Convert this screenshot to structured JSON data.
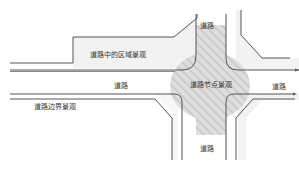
{
  "diagram": {
    "title": "",
    "labels": {
      "inner_area": "道路中的区域景观",
      "road_main": "道路",
      "road_right": "道路",
      "road_top": "道路",
      "road_bottom": "道路",
      "node": "道路节点景观",
      "edge": "道路边界景观"
    },
    "colors": {
      "line": "#555555",
      "area_fill": "#f2f2f2",
      "node_fill": "#d9d9d9",
      "hatch": "#c4c4c4",
      "text": "#333333",
      "background": "#ffffff"
    }
  }
}
